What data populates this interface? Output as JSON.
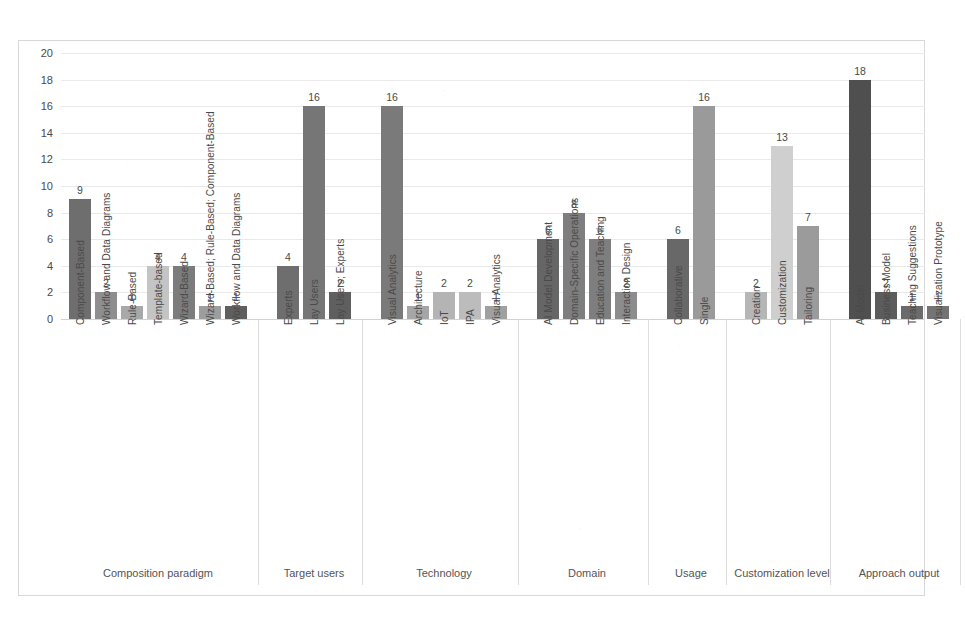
{
  "chart_data": {
    "type": "bar",
    "title": "",
    "xlabel": "",
    "ylabel": "",
    "ylim": [
      0,
      20
    ],
    "ytick_step": 2,
    "yticks": [
      "0",
      "2",
      "4",
      "6",
      "8",
      "10",
      "12",
      "14",
      "16",
      "18",
      "20"
    ],
    "grid": true,
    "legend": "none",
    "value_labels": true,
    "groups": [
      {
        "name": "Composition paradigm",
        "categories": [
          "Component-Based",
          "Workflow and Data Diagrams",
          "Rule-Based",
          "Template-based",
          "Wizard-Based",
          "Wizard-Based; Rule-Based; Component-Based",
          "Workflow and Data Diagrams"
        ],
        "values": [
          9,
          2,
          1,
          4,
          4,
          1,
          1
        ],
        "colors": [
          "#6e6e6e",
          "#8e8e8e",
          "#a8a8a8",
          "#c4c4c4",
          "#7c7c7c",
          "#9d9d9d",
          "#5f5f5f"
        ]
      },
      {
        "name": "Target users",
        "categories": [
          "Experts",
          "Lay Users",
          "Lay Users; Experts"
        ],
        "values": [
          4,
          16,
          2
        ],
        "colors": [
          "#6e6e6e",
          "#767676",
          "#5f5f5f"
        ]
      },
      {
        "name": "Technology",
        "categories": [
          "Visual Analytics",
          "Architecture",
          "IoT",
          "IPA",
          "Visual Analytics"
        ],
        "values": [
          16,
          1,
          2,
          2,
          1
        ],
        "colors": [
          "#7a7a7a",
          "#a6a6a6",
          "#b4b4b4",
          "#bcbcbc",
          "#a0a0a0"
        ]
      },
      {
        "name": "Domain",
        "categories": [
          "AI Model Development",
          "Domain-Specific Operations",
          "Education and Teaching",
          "Interaction Design"
        ],
        "values": [
          6,
          8,
          6,
          2
        ],
        "colors": [
          "#666666",
          "#7e7e7e",
          "#7e7e7e",
          "#8c8c8c"
        ]
      },
      {
        "name": "Usage",
        "categories": [
          "Collaborative",
          "Single"
        ],
        "values": [
          6,
          16
        ],
        "colors": [
          "#686868",
          "#9a9a9a"
        ]
      },
      {
        "name": "Customization level",
        "categories": [
          "Creation",
          "Customization",
          "Tailoring"
        ],
        "values": [
          2,
          13,
          7
        ],
        "colors": [
          "#b6b6b6",
          "#cfcfcf",
          "#9b9b9b"
        ]
      },
      {
        "name": "Approach output",
        "categories": [
          "AI Model",
          "Business Model",
          "Teaching Suggestions",
          "Visualization Prototype"
        ],
        "values": [
          18,
          2,
          1,
          1
        ],
        "colors": [
          "#4f4f4f",
          "#5c5c5c",
          "#6b6b6b",
          "#747474"
        ]
      }
    ]
  },
  "style": {
    "background": "#ffffff",
    "grid_color": "#e9e9e9",
    "axis_color": "#d2d2d2",
    "text_color": "#4a4a4a"
  }
}
